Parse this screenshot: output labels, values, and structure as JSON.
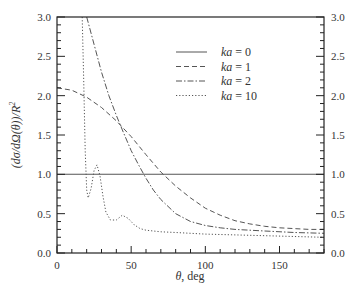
{
  "chart_data": {
    "type": "line",
    "title": "",
    "xlabel": "θ, deg",
    "ylabel": "(dσ/dΩ(θ))/R²",
    "xlim": [
      0,
      180
    ],
    "ylim": [
      0,
      3.0
    ],
    "x_ticks": [
      0,
      50,
      100,
      150
    ],
    "y_ticks": [
      0.0,
      0.5,
      1.0,
      1.5,
      2.0,
      2.5,
      3.0
    ],
    "y_tick_labels": [
      "0.0",
      "0.5",
      "1.0",
      "1.5",
      "2.0",
      "2.5",
      "3.0"
    ],
    "right_axis_mirrored": true,
    "grid": false,
    "legend_position": "upper right (inside)",
    "series": [
      {
        "name": "ka = 0",
        "style": "solid",
        "x": [
          0,
          180
        ],
        "y": [
          1.0,
          1.0
        ]
      },
      {
        "name": "ka = 1",
        "style": "dashed",
        "x": [
          0,
          10,
          20,
          30,
          40,
          50,
          60,
          70,
          80,
          90,
          100,
          110,
          120,
          130,
          140,
          150,
          160,
          170,
          180
        ],
        "y": [
          2.1,
          2.07,
          1.98,
          1.85,
          1.68,
          1.48,
          1.25,
          1.03,
          0.85,
          0.7,
          0.57,
          0.48,
          0.41,
          0.37,
          0.34,
          0.32,
          0.31,
          0.3,
          0.3
        ]
      },
      {
        "name": "ka = 2",
        "style": "dash-dot",
        "x": [
          20,
          25,
          30,
          35,
          40,
          45,
          50,
          55,
          60,
          65,
          70,
          80,
          90,
          100,
          110,
          120,
          140,
          160,
          180
        ],
        "y": [
          3.0,
          2.65,
          2.3,
          2.0,
          1.75,
          1.52,
          1.3,
          1.12,
          0.95,
          0.8,
          0.68,
          0.5,
          0.4,
          0.35,
          0.32,
          0.3,
          0.28,
          0.26,
          0.25
        ]
      },
      {
        "name": "ka = 10",
        "style": "dotted",
        "x": [
          17,
          18,
          19,
          20,
          21,
          23,
          25,
          27,
          29,
          31,
          33,
          36,
          40,
          44,
          48,
          52,
          56,
          60,
          70,
          80,
          100,
          120,
          140,
          160,
          180
        ],
        "y": [
          3.0,
          2.2,
          1.3,
          0.8,
          0.7,
          0.82,
          1.05,
          1.12,
          0.98,
          0.72,
          0.52,
          0.42,
          0.42,
          0.48,
          0.44,
          0.36,
          0.31,
          0.29,
          0.27,
          0.26,
          0.24,
          0.23,
          0.22,
          0.21,
          0.2
        ]
      }
    ]
  },
  "legend": {
    "items": [
      {
        "label": "ka = 0",
        "dash": ""
      },
      {
        "label": "ka = 1",
        "dash": "5,3"
      },
      {
        "label": "ka = 2",
        "dash": "6,2,1.5,2"
      },
      {
        "label": "ka = 10",
        "dash": "1.2,2"
      }
    ]
  },
  "axes": {
    "xlabel": "θ, deg",
    "ylabel_parts": {
      "main": "(dσ/dΩ(θ))/R",
      "sup": "2"
    },
    "x_tick_labels": [
      "0",
      "50",
      "100",
      "150"
    ]
  },
  "colors": {
    "frame": "#222222",
    "line": "#555555",
    "text": "#333333"
  }
}
